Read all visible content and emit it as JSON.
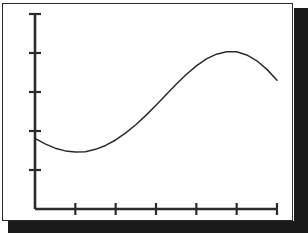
{
  "figure": {
    "frame": {
      "border_color": "#2b2b2b",
      "background_color": "#ffffff",
      "shadow_color": "#1a1a1a"
    },
    "axis_color": "#2b2b2b",
    "curve_color": "#2b2b2b"
  },
  "chart_data": {
    "type": "line",
    "title": "",
    "subtitle": "",
    "xlabel": "",
    "ylabel": "",
    "grid": false,
    "legend": null,
    "legend_position": "none",
    "annotations": [],
    "x_tick_labels": [
      "",
      "",
      "",
      "",
      "",
      ""
    ],
    "y_tick_labels": [
      "",
      "",
      "",
      "",
      ""
    ],
    "x_tick_count": 6,
    "y_tick_count": 5,
    "xlim": [
      0,
      6
    ],
    "ylim": [
      0,
      5
    ],
    "series": [
      {
        "name": "curve",
        "x": [
          0.0,
          0.25,
          0.5,
          0.75,
          1.0,
          1.25,
          1.5,
          1.75,
          2.0,
          2.25,
          2.5,
          2.75,
          3.0,
          3.25,
          3.5,
          3.75,
          4.0,
          4.25,
          4.5,
          4.75,
          5.0,
          5.25,
          5.5,
          5.75,
          6.0
        ],
        "y": [
          1.81,
          1.67,
          1.56,
          1.49,
          1.46,
          1.47,
          1.53,
          1.63,
          1.77,
          1.95,
          2.16,
          2.4,
          2.66,
          2.93,
          3.2,
          3.45,
          3.67,
          3.85,
          3.97,
          4.03,
          4.03,
          3.95,
          3.8,
          3.58,
          3.3
        ]
      }
    ]
  }
}
